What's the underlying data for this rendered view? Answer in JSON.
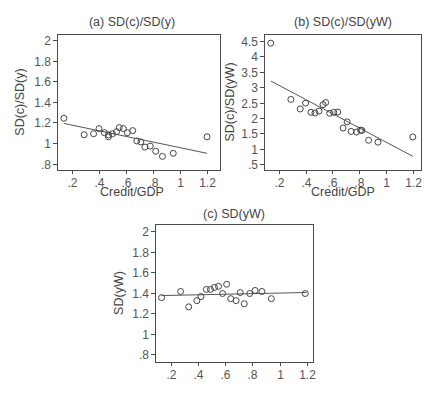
{
  "chart_data": [
    {
      "type": "scatter",
      "title": "(a) SD(c)/SD(y)",
      "xlabel": "Credit/GDP",
      "ylabel": "SD(c)/SD(y)",
      "xlim": [
        0.1,
        1.22
      ],
      "ylim": [
        0.75,
        2.05
      ],
      "xticks": [
        0.2,
        0.4,
        0.6,
        0.8,
        1,
        1.2
      ],
      "xtick_labels": [
        ".2",
        ".4",
        ".6",
        ".8",
        "1",
        "1.2"
      ],
      "yticks": [
        0.8,
        1,
        1.2,
        1.4,
        1.6,
        1.8,
        2
      ],
      "ytick_labels": [
        ".8",
        "1",
        "1.2",
        "1.4",
        "1.6",
        "1.8",
        "2"
      ],
      "grid": false,
      "points": [
        [
          0.14,
          1.24
        ],
        [
          0.29,
          1.08
        ],
        [
          0.36,
          1.09
        ],
        [
          0.4,
          1.14
        ],
        [
          0.44,
          1.1
        ],
        [
          0.47,
          1.06
        ],
        [
          0.47,
          1.08
        ],
        [
          0.5,
          1.09
        ],
        [
          0.53,
          1.11
        ],
        [
          0.55,
          1.15
        ],
        [
          0.58,
          1.14
        ],
        [
          0.61,
          1.1
        ],
        [
          0.65,
          1.12
        ],
        [
          0.68,
          1.02
        ],
        [
          0.71,
          1.01
        ],
        [
          0.74,
          0.96
        ],
        [
          0.78,
          0.97
        ],
        [
          0.82,
          0.92
        ],
        [
          0.87,
          0.87
        ],
        [
          0.95,
          0.9
        ],
        [
          1.2,
          1.06
        ]
      ],
      "fit_line": [
        [
          0.14,
          1.19
        ],
        [
          1.2,
          0.9
        ]
      ]
    },
    {
      "type": "scatter",
      "title": "(b) SD(c)/SD(yW)",
      "xlabel": "Credit/GDP",
      "ylabel": "SD(c)/SD(yW)",
      "xlim": [
        0.1,
        1.22
      ],
      "ylim": [
        0.3,
        4.72
      ],
      "xticks": [
        0.2,
        0.4,
        0.6,
        0.8,
        1,
        1.2
      ],
      "xtick_labels": [
        ".2",
        ".4",
        ".6",
        ".8",
        "1",
        "1.2"
      ],
      "yticks": [
        0.5,
        1,
        1.5,
        2,
        2.5,
        3,
        3.5,
        4,
        4.5
      ],
      "ytick_labels": [
        ".5",
        "1",
        "1.5",
        "2",
        "2.5",
        "3",
        "3.5",
        "4",
        "4.5"
      ],
      "grid": false,
      "points": [
        [
          0.14,
          4.43
        ],
        [
          0.29,
          2.6
        ],
        [
          0.36,
          2.29
        ],
        [
          0.4,
          2.48
        ],
        [
          0.44,
          2.18
        ],
        [
          0.47,
          2.16
        ],
        [
          0.5,
          2.22
        ],
        [
          0.53,
          2.43
        ],
        [
          0.55,
          2.5
        ],
        [
          0.58,
          2.15
        ],
        [
          0.61,
          2.18
        ],
        [
          0.64,
          2.19
        ],
        [
          0.68,
          1.67
        ],
        [
          0.71,
          1.87
        ],
        [
          0.74,
          1.56
        ],
        [
          0.78,
          1.54
        ],
        [
          0.81,
          1.6
        ],
        [
          0.82,
          1.59
        ],
        [
          0.87,
          1.27
        ],
        [
          0.94,
          1.21
        ],
        [
          1.2,
          1.38
        ]
      ],
      "fit_line": [
        [
          0.14,
          3.2
        ],
        [
          1.2,
          0.75
        ]
      ]
    },
    {
      "type": "scatter",
      "title": "(c) SD(yW)",
      "xlabel": "",
      "ylabel": "SD(yW)",
      "xlim": [
        0.1,
        1.22
      ],
      "ylim": [
        0.75,
        2.05
      ],
      "xticks": [
        0.2,
        0.4,
        0.6,
        0.8,
        1,
        1.2
      ],
      "xtick_labels": [
        ".2",
        ".4",
        ".6",
        ".8",
        "1",
        "1.2"
      ],
      "yticks": [
        0.8,
        1,
        1.2,
        1.4,
        1.6,
        1.8,
        2
      ],
      "ytick_labels": [
        ".8",
        "1",
        "1.2",
        "1.4",
        "1.6",
        "1.8",
        "2"
      ],
      "grid": false,
      "points": [
        [
          0.13,
          1.35
        ],
        [
          0.27,
          1.41
        ],
        [
          0.33,
          1.26
        ],
        [
          0.39,
          1.32
        ],
        [
          0.42,
          1.36
        ],
        [
          0.46,
          1.43
        ],
        [
          0.49,
          1.43
        ],
        [
          0.52,
          1.45
        ],
        [
          0.55,
          1.46
        ],
        [
          0.58,
          1.39
        ],
        [
          0.61,
          1.48
        ],
        [
          0.64,
          1.34
        ],
        [
          0.68,
          1.32
        ],
        [
          0.71,
          1.4
        ],
        [
          0.74,
          1.29
        ],
        [
          0.78,
          1.39
        ],
        [
          0.82,
          1.42
        ],
        [
          0.87,
          1.41
        ],
        [
          0.94,
          1.34
        ],
        [
          1.19,
          1.39
        ]
      ],
      "fit_line": [
        [
          0.13,
          1.37
        ],
        [
          1.2,
          1.4
        ]
      ]
    }
  ],
  "panels": {
    "a": {
      "title": "(a) SD(c)/SD(y)",
      "xlabel": "Credit/GDP",
      "ylabel": "SD(c)/SD(y)"
    },
    "b": {
      "title": "(b) SD(c)/SD(yW)",
      "xlabel": "Credit/GDP",
      "ylabel": "SD(c)/SD(yW)"
    },
    "c": {
      "title": "(c) SD(yW)",
      "ylabel": "SD(yW)"
    }
  }
}
